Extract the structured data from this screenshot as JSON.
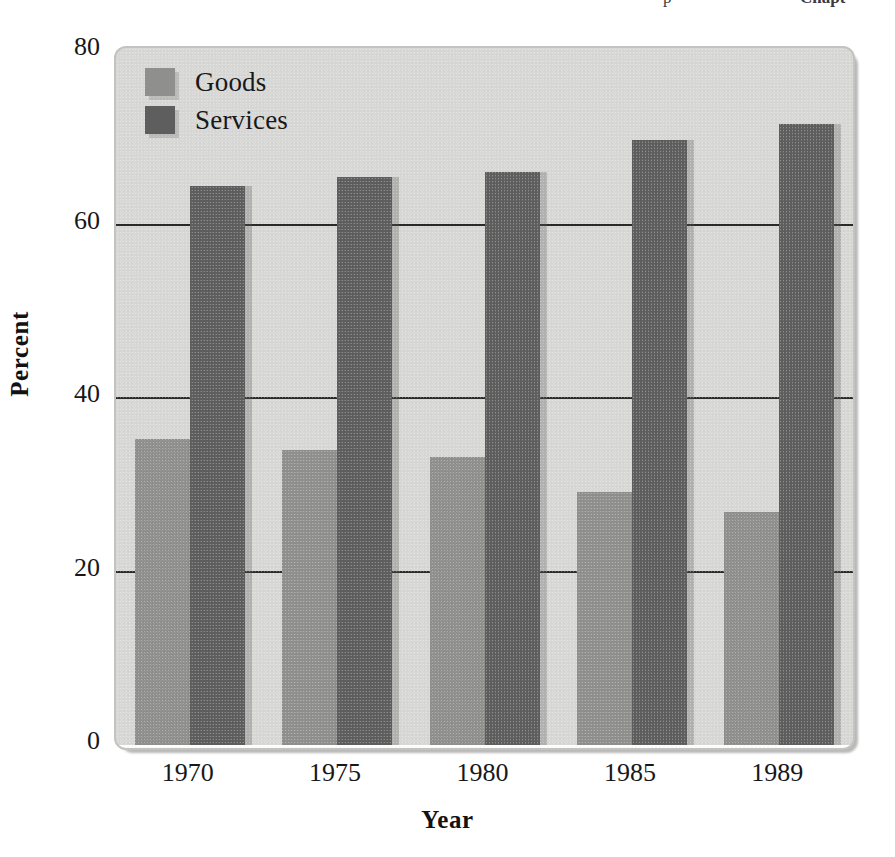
{
  "page_header": {
    "left_fragment": "p",
    "right_fragment": "Chapt"
  },
  "figure": {
    "panel_color": "#d8d8d6",
    "goods_color": "#8f8f8d",
    "services_color": "#5e5e5e",
    "gridline_color": "#2a2a2a"
  },
  "axes": {
    "ylabel": "Percent",
    "xlabel": "Year",
    "yticks": [
      "80",
      "60",
      "40",
      "20",
      "0"
    ],
    "ytick_values": [
      80,
      60,
      40,
      20,
      0
    ],
    "xticks": [
      "1970",
      "1975",
      "1980",
      "1985",
      "1989"
    ]
  },
  "legend": {
    "position": "top-left-inside",
    "entries": [
      {
        "label": "Goods",
        "color": "#8f8f8d"
      },
      {
        "label": "Services",
        "color": "#5e5e5e"
      }
    ]
  },
  "chart_data": {
    "type": "bar",
    "title": "",
    "subtitle": "",
    "xlabel": "Year",
    "ylabel": "Percent",
    "categories": [
      "1970",
      "1975",
      "1980",
      "1985",
      "1989"
    ],
    "series": [
      {
        "name": "Goods",
        "color": "#8f8f8d",
        "values": [
          35.3,
          34.0,
          33.2,
          29.2,
          26.9
        ]
      },
      {
        "name": "Services",
        "color": "#5e5e5e",
        "values": [
          64.4,
          65.5,
          66.1,
          69.8,
          71.6
        ]
      }
    ],
    "ylim": [
      0,
      80
    ],
    "ytick_step": 20,
    "grid": "horizontal",
    "legend_position": "upper left",
    "annotations": []
  }
}
